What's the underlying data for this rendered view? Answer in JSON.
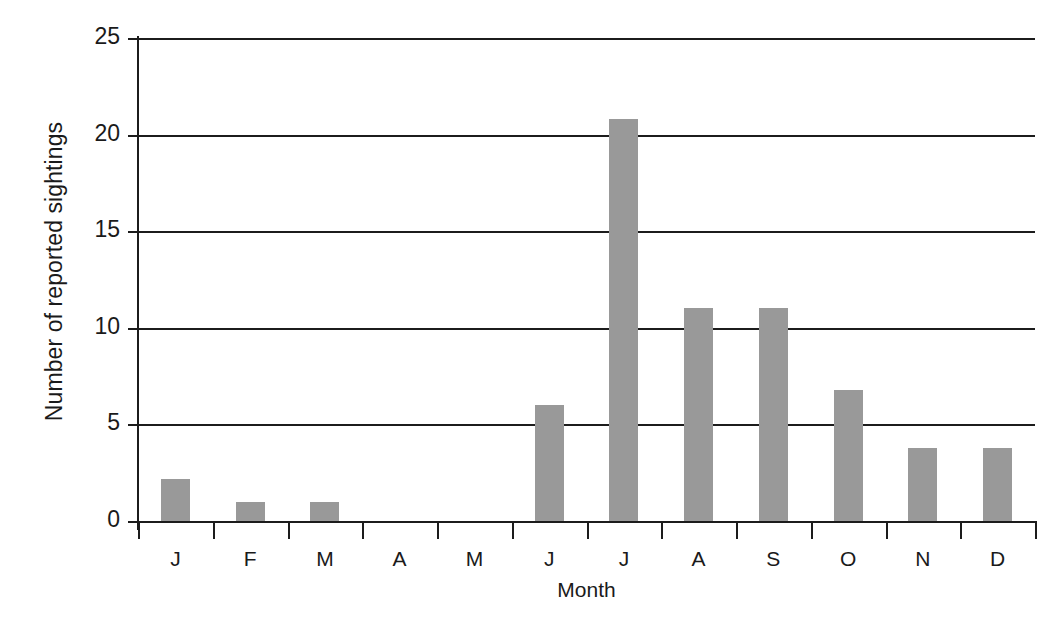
{
  "chart_data": {
    "type": "bar",
    "title": "",
    "xlabel": "Month",
    "ylabel": "Number of reported sightings",
    "categories": [
      "J",
      "F",
      "M",
      "A",
      "M",
      "J",
      "J",
      "A",
      "S",
      "O",
      "N",
      "D"
    ],
    "values": [
      2.2,
      1.0,
      1.0,
      0,
      0,
      6.0,
      20.8,
      11.0,
      11.0,
      6.8,
      3.8,
      3.8
    ],
    "ylim": [
      0,
      25
    ],
    "yticks": [
      0,
      5,
      10,
      15,
      20,
      25
    ],
    "ytick_labels": [
      "0",
      "5",
      "10",
      "15",
      "20",
      "25"
    ],
    "grid": true,
    "grid_orientation": "horizontal",
    "legend": false,
    "bar_color": "#999999",
    "axis_color": "#1c1c1c",
    "background": "#ffffff"
  }
}
